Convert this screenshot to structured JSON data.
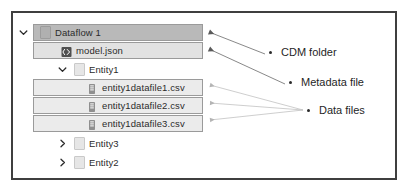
{
  "diagram": {
    "frame_border_color": "#3f3f3f"
  },
  "tree": {
    "rows": [
      {
        "id": "dataflow-1",
        "label": "Dataflow 1",
        "icon": "folder-icon",
        "chevron": "chevron-down-icon",
        "expanded": "true",
        "highlight": "dark",
        "depth": 0
      },
      {
        "id": "model-json",
        "label": "model.json",
        "icon": "json-file-icon",
        "chevron": "none",
        "expanded": "",
        "highlight": "mid",
        "depth": 1
      },
      {
        "id": "entity1",
        "label": "Entity1",
        "icon": "folder-icon",
        "chevron": "chevron-down-icon",
        "expanded": "true",
        "highlight": "none",
        "depth": 1
      },
      {
        "id": "entity1datafile1",
        "label": "entity1datafile1.csv",
        "icon": "csv-file-icon",
        "chevron": "none",
        "expanded": "",
        "highlight": "light",
        "depth": 2
      },
      {
        "id": "entity1datafile2",
        "label": "entity1datafile2.csv",
        "icon": "csv-file-icon",
        "chevron": "none",
        "expanded": "",
        "highlight": "light",
        "depth": 2
      },
      {
        "id": "entity1datafile3",
        "label": "entity1datafile3.csv",
        "icon": "csv-file-icon",
        "chevron": "none",
        "expanded": "",
        "highlight": "light",
        "depth": 2
      },
      {
        "id": "entity3",
        "label": "Entity3",
        "icon": "folder-icon",
        "chevron": "chevron-right-icon",
        "expanded": "false",
        "highlight": "none",
        "depth": 1
      },
      {
        "id": "entity2",
        "label": "Entity2",
        "icon": "folder-icon",
        "chevron": "chevron-right-icon",
        "expanded": "false",
        "highlight": "none",
        "depth": 1
      }
    ]
  },
  "annotations": [
    {
      "id": "cdm-folder",
      "label": "CDM folder",
      "targets": "dataflow-1"
    },
    {
      "id": "metadata-file",
      "label": "Metadata file",
      "targets": "model.json"
    },
    {
      "id": "data-files",
      "label": "Data files",
      "targets": "entity1datafile1.csv, entity1datafile2.csv, entity1datafile3.csv"
    }
  ]
}
